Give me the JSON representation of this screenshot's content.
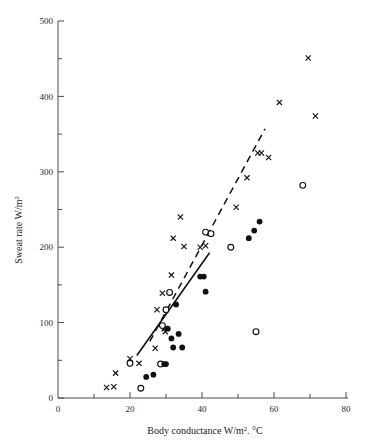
{
  "chart_data": {
    "type": "scatter",
    "title": "",
    "xlabel": "Body conductance W/m². °C",
    "ylabel": "Sweat rate W/m²",
    "xlabel_parts": {
      "main": "Body conductance W/m",
      "sup": "2",
      "tail": ". °C"
    },
    "ylabel_parts": {
      "main": "Sweat rate W/m",
      "sup": "2"
    },
    "xlim": [
      0,
      80
    ],
    "ylim": [
      0,
      500
    ],
    "xticks": [
      0,
      10,
      20,
      30,
      40,
      50,
      60,
      70,
      80
    ],
    "xticklabels": [
      "0",
      "",
      "20",
      "",
      "40",
      "",
      "60",
      "",
      "80"
    ],
    "yticks": [
      0,
      50,
      100,
      150,
      200,
      250,
      300,
      350,
      400,
      450,
      500
    ],
    "yticklabels": [
      "0",
      "",
      "100",
      "",
      "200",
      "",
      "300",
      "",
      "400",
      "",
      "500"
    ],
    "grid": false,
    "legend": "none",
    "series": [
      {
        "name": "cross",
        "marker": "x",
        "color": "#111111",
        "points": [
          [
            13.5,
            14
          ],
          [
            15.5,
            15
          ],
          [
            16.0,
            33
          ],
          [
            20.0,
            52
          ],
          [
            22.5,
            46
          ],
          [
            27.0,
            66
          ],
          [
            27.5,
            117
          ],
          [
            29.0,
            139
          ],
          [
            29.5,
            92
          ],
          [
            29.8,
            88
          ],
          [
            31.5,
            163
          ],
          [
            32.0,
            212
          ],
          [
            34.0,
            240
          ],
          [
            35.0,
            201
          ],
          [
            39.5,
            200
          ],
          [
            41.0,
            202
          ],
          [
            49.5,
            253
          ],
          [
            52.5,
            292
          ],
          [
            55.5,
            325
          ],
          [
            56.5,
            325
          ],
          [
            58.5,
            319
          ],
          [
            61.5,
            392
          ],
          [
            69.5,
            451
          ],
          [
            71.5,
            374
          ]
        ]
      },
      {
        "name": "open-circle",
        "marker": "o",
        "color": "#111111",
        "points": [
          [
            20.0,
            46
          ],
          [
            23.0,
            13
          ],
          [
            28.5,
            45
          ],
          [
            29.0,
            96
          ],
          [
            30.0,
            117
          ],
          [
            31.0,
            140
          ],
          [
            41.0,
            220
          ],
          [
            42.5,
            218
          ],
          [
            48.0,
            200
          ],
          [
            55.0,
            88
          ],
          [
            68.0,
            282
          ]
        ]
      },
      {
        "name": "filled-circle",
        "marker": "●",
        "color": "#111111",
        "points": [
          [
            24.5,
            28
          ],
          [
            26.5,
            31
          ],
          [
            29.5,
            45
          ],
          [
            30.0,
            45
          ],
          [
            30.5,
            92
          ],
          [
            31.5,
            79
          ],
          [
            32.0,
            67
          ],
          [
            33.5,
            85
          ],
          [
            32.8,
            124
          ],
          [
            34.5,
            67
          ],
          [
            39.5,
            161
          ],
          [
            40.5,
            161
          ],
          [
            41.0,
            141
          ],
          [
            53.0,
            212
          ],
          [
            54.5,
            222
          ],
          [
            56.0,
            234
          ]
        ]
      }
    ],
    "fit_lines": [
      {
        "name": "solid-regression",
        "style": "solid",
        "x0": 22.0,
        "y0": 57,
        "x1": 42.0,
        "y1": 192
      },
      {
        "name": "dashed-regression",
        "style": "dashed",
        "x0": 25.5,
        "y0": 75,
        "x1": 57.5,
        "y1": 357
      }
    ]
  }
}
